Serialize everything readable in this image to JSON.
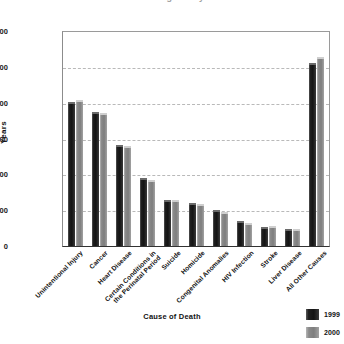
{
  "chart_data": {
    "type": "bar",
    "title": "Years of Potential Life Lost Before Age 75 by Cause of Death",
    "title_clipped": true,
    "xlabel": "Cause of Death",
    "ylabel": "Years",
    "ylim": [
      0,
      3000000
    ],
    "ytick_labels": [
      "3,000,000",
      "2,500,000",
      "2,000,000",
      "1,500,000",
      "1,000,000",
      "500,000",
      "0"
    ],
    "ytick_values": [
      3000000,
      2500000,
      2000000,
      1500000,
      1000000,
      500000,
      0
    ],
    "grid": true,
    "legend_position": "bottom-right",
    "categories": [
      "Unintentional Injury",
      "Cancer",
      "Heart Disease",
      "Certain Conditions in\nthe Perinatal Period",
      "Suicide",
      "Homicide",
      "Congenital Anomalies",
      "HIV Infection",
      "Stroke",
      "Liver Disease",
      "All Other Causes"
    ],
    "series": [
      {
        "name": "1999",
        "color": "#1a1a1a",
        "values": [
          2020000,
          1880000,
          1420000,
          950000,
          650000,
          600000,
          500000,
          350000,
          270000,
          240000,
          2560000
        ]
      },
      {
        "name": "2000",
        "color": "#858585",
        "values": [
          2040000,
          1870000,
          1400000,
          930000,
          640000,
          590000,
          480000,
          320000,
          275000,
          235000,
          2650000
        ]
      }
    ]
  },
  "legend": {
    "items": [
      {
        "label": "1999"
      },
      {
        "label": "2000"
      }
    ]
  }
}
